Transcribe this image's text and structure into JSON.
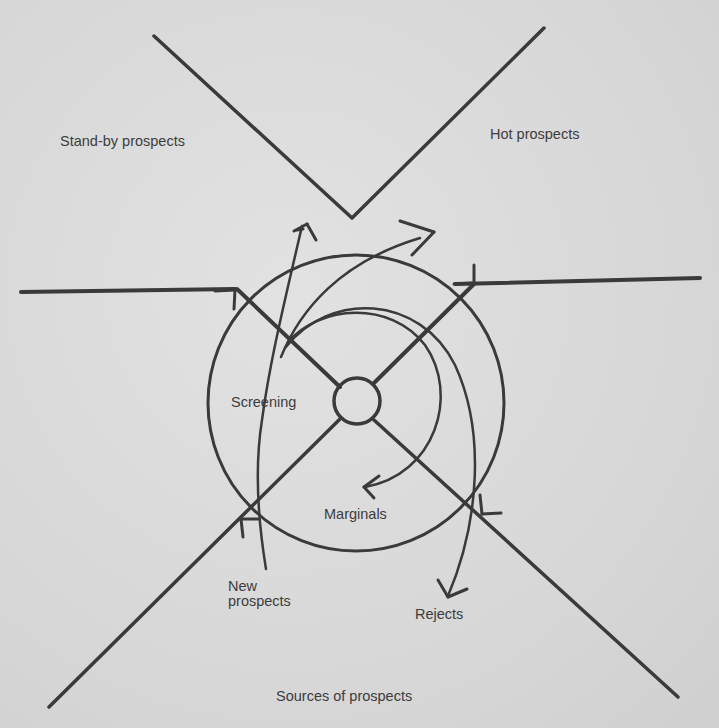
{
  "diagram": {
    "labels": {
      "standby": "Stand-by prospects",
      "hot": "Hot prospects",
      "screening": "Screening",
      "marginals": "Marginals",
      "new_line1": "New",
      "new_line2": "prospects",
      "rejects": "Rejects",
      "sources": "Sources of prospects"
    },
    "colors": {
      "ink": "#3a3a3a",
      "paper": "#dcdcdc"
    }
  }
}
